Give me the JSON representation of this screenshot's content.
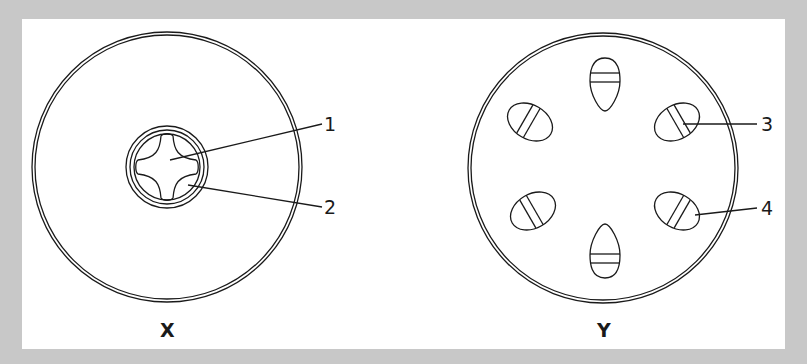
{
  "diagram": {
    "background": "#c8c8c8",
    "panel_color": "#ffffff",
    "stroke_color": "#1a1a1a",
    "figures": [
      {
        "id": "X",
        "caption": "X",
        "description": "Cross-section with central vascular core (cross-shaped xylem) inside a small ring",
        "labels": [
          {
            "number": "1",
            "points_to": "cross-shaped central tissue"
          },
          {
            "number": "2",
            "points_to": "tissue between cross arms"
          }
        ]
      },
      {
        "id": "Y",
        "caption": "Y",
        "description": "Cross-section with six vascular bundles arranged in a ring",
        "labels": [
          {
            "number": "3",
            "points_to": "upper-right vascular bundle, outer band"
          },
          {
            "number": "4",
            "points_to": "lower-right vascular bundle, outer part"
          }
        ]
      }
    ]
  }
}
